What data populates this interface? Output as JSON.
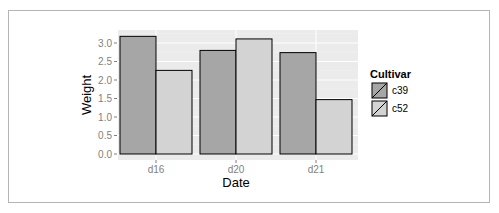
{
  "chart_data": {
    "type": "bar",
    "title": "",
    "xlabel": "Date",
    "ylabel": "Weight",
    "categories": [
      "d16",
      "d20",
      "d21"
    ],
    "series": [
      {
        "name": "c39",
        "values": [
          3.18,
          2.8,
          2.74
        ],
        "color": "#a6a6a6"
      },
      {
        "name": "c52",
        "values": [
          2.26,
          3.11,
          1.47
        ],
        "color": "#d3d3d3"
      }
    ],
    "ylim": [
      0,
      3.2
    ],
    "yticks": [
      0.0,
      0.5,
      1.0,
      1.5,
      2.0,
      2.5,
      3.0
    ],
    "ytick_labels": [
      "0.0",
      "0.5",
      "1.0",
      "1.5",
      "2.0",
      "2.5",
      "3.0"
    ],
    "grid": true,
    "legend": {
      "title": "Cultivar",
      "position": "right",
      "entries": [
        "c39",
        "c52"
      ]
    },
    "panel_background": "#ebebeb",
    "bar_outline": "#000000"
  }
}
